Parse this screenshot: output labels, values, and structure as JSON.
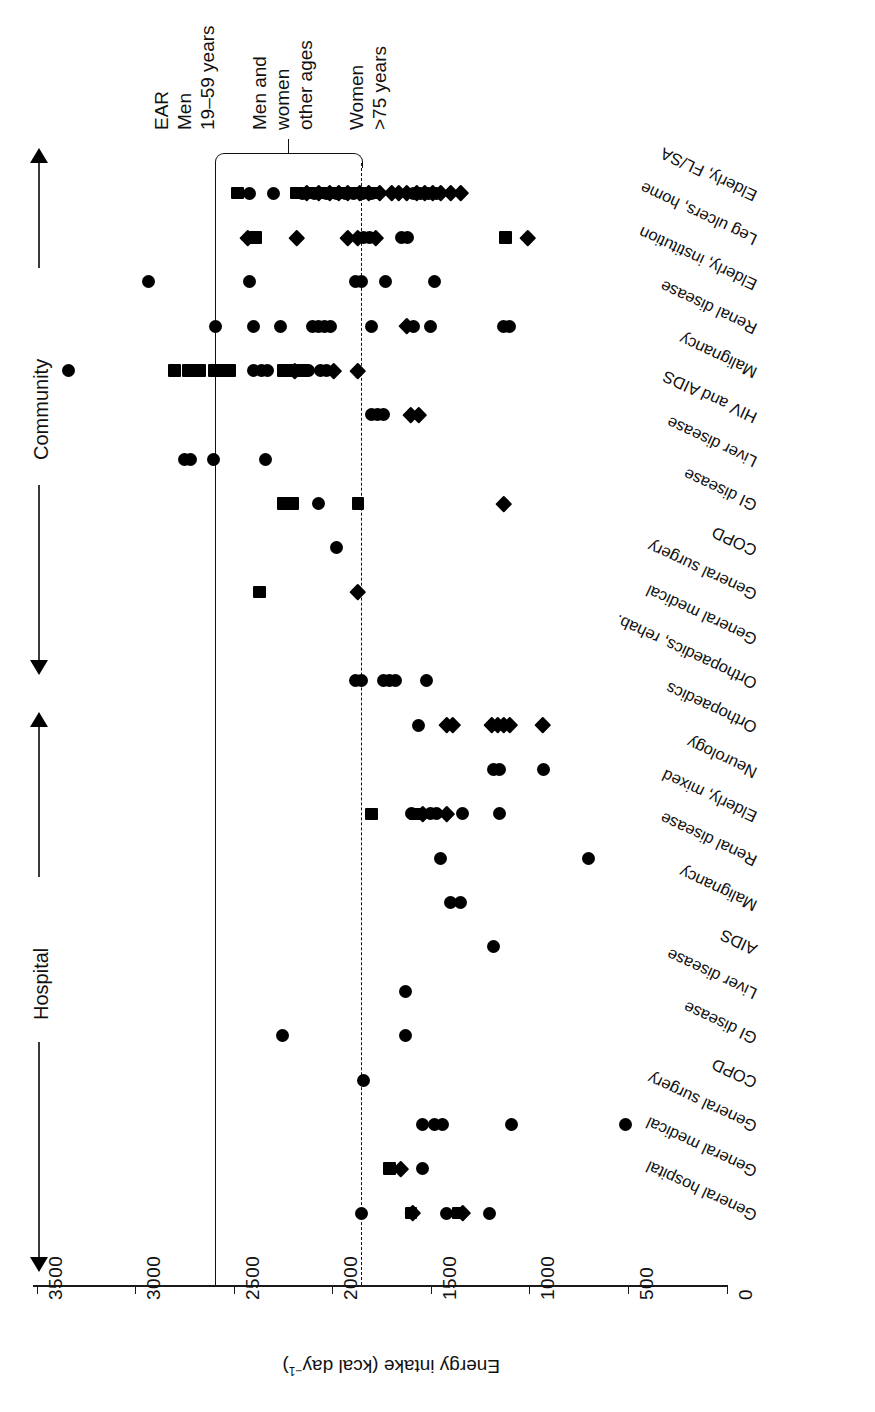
{
  "figure": {
    "axis_title": "Energy intake (kcal day",
    "axis_title_sup": "−1",
    "axis_title_close": ")",
    "tick_labels": [
      "3500",
      "3000",
      "2500",
      "2000",
      "1500",
      "1000",
      "500",
      "0"
    ],
    "tick_values": [
      3500,
      3000,
      2500,
      2000,
      1500,
      1000,
      500,
      0
    ]
  },
  "groups": {
    "community": "Community",
    "hospital": "Hospital"
  },
  "annotations": {
    "ear_line1": "EAR",
    "ear_line2": "Men",
    "ear_line3": "19–59 years",
    "mid_line1": "Men and",
    "mid_line2": "women",
    "mid_line3": "other ages",
    "low_line1": "Women",
    "low_line2": ">75 years"
  },
  "reference_lines": [
    {
      "name": "EAR men 19-59 years",
      "value": 2600,
      "style": "solid"
    },
    {
      "name": "Women >75 years",
      "value": 1850,
      "style": "dash-dot"
    }
  ],
  "chart_data": {
    "type": "scatter",
    "title": "",
    "xlabel": "Energy intake (kcal day−1)",
    "ylabel": "",
    "xlim": [
      0,
      3500
    ],
    "grid": false,
    "legend": "none",
    "orientation": "rotated-180",
    "marker_types": [
      "square",
      "circle",
      "diamond"
    ],
    "categories": [
      {
        "group": "Community",
        "label": "Elderly, FL/SA",
        "points": [
          {
            "v": 2480,
            "m": "square"
          },
          {
            "v": 2420,
            "m": "circle"
          },
          {
            "v": 2300,
            "m": "circle"
          },
          {
            "v": 2180,
            "m": "square"
          },
          {
            "v": 2150,
            "m": "circle"
          },
          {
            "v": 2130,
            "m": "diamond"
          },
          {
            "v": 2110,
            "m": "square"
          },
          {
            "v": 2090,
            "m": "circle"
          },
          {
            "v": 2070,
            "m": "diamond"
          },
          {
            "v": 2050,
            "m": "square"
          },
          {
            "v": 2030,
            "m": "circle"
          },
          {
            "v": 2010,
            "m": "diamond"
          },
          {
            "v": 1995,
            "m": "square"
          },
          {
            "v": 1980,
            "m": "circle"
          },
          {
            "v": 1965,
            "m": "diamond"
          },
          {
            "v": 1950,
            "m": "square"
          },
          {
            "v": 1935,
            "m": "circle"
          },
          {
            "v": 1920,
            "m": "diamond"
          },
          {
            "v": 1905,
            "m": "square"
          },
          {
            "v": 1890,
            "m": "circle"
          },
          {
            "v": 1875,
            "m": "square"
          },
          {
            "v": 1860,
            "m": "diamond"
          },
          {
            "v": 1845,
            "m": "circle"
          },
          {
            "v": 1830,
            "m": "square"
          },
          {
            "v": 1815,
            "m": "diamond"
          },
          {
            "v": 1800,
            "m": "circle"
          },
          {
            "v": 1780,
            "m": "square"
          },
          {
            "v": 1760,
            "m": "diamond"
          },
          {
            "v": 1700,
            "m": "diamond"
          },
          {
            "v": 1660,
            "m": "diamond"
          },
          {
            "v": 1620,
            "m": "diamond"
          },
          {
            "v": 1590,
            "m": "circle"
          },
          {
            "v": 1570,
            "m": "diamond"
          },
          {
            "v": 1550,
            "m": "circle"
          },
          {
            "v": 1530,
            "m": "diamond"
          },
          {
            "v": 1510,
            "m": "circle"
          },
          {
            "v": 1490,
            "m": "diamond"
          },
          {
            "v": 1470,
            "m": "circle"
          },
          {
            "v": 1450,
            "m": "diamond"
          },
          {
            "v": 1400,
            "m": "diamond"
          },
          {
            "v": 1350,
            "m": "diamond"
          }
        ]
      },
      {
        "group": "Community",
        "label": "Leg ulcers, home",
        "points": [
          {
            "v": 2430,
            "m": "diamond"
          },
          {
            "v": 2390,
            "m": "square"
          },
          {
            "v": 2180,
            "m": "diamond"
          },
          {
            "v": 1920,
            "m": "diamond"
          },
          {
            "v": 1870,
            "m": "diamond"
          },
          {
            "v": 1840,
            "m": "circle"
          },
          {
            "v": 1810,
            "m": "circle"
          },
          {
            "v": 1780,
            "m": "diamond"
          },
          {
            "v": 1650,
            "m": "circle"
          },
          {
            "v": 1620,
            "m": "circle"
          },
          {
            "v": 1120,
            "m": "square"
          },
          {
            "v": 1010,
            "m": "diamond"
          }
        ]
      },
      {
        "group": "Community",
        "label": "Elderly, institution",
        "points": [
          {
            "v": 1880,
            "m": "circle"
          },
          {
            "v": 1850,
            "m": "circle"
          },
          {
            "v": 1730,
            "m": "circle"
          },
          {
            "v": 2930,
            "m": "circle"
          },
          {
            "v": 2420,
            "m": "circle"
          },
          {
            "v": 1480,
            "m": "circle"
          }
        ]
      },
      {
        "group": "Community",
        "label": "Renal disease",
        "points": [
          {
            "v": 2590,
            "m": "circle"
          },
          {
            "v": 2400,
            "m": "circle"
          },
          {
            "v": 2260,
            "m": "circle"
          },
          {
            "v": 2100,
            "m": "circle"
          },
          {
            "v": 2070,
            "m": "circle"
          },
          {
            "v": 2040,
            "m": "circle"
          },
          {
            "v": 2010,
            "m": "circle"
          },
          {
            "v": 1800,
            "m": "circle"
          },
          {
            "v": 1620,
            "m": "diamond"
          },
          {
            "v": 1590,
            "m": "circle"
          },
          {
            "v": 1500,
            "m": "circle"
          },
          {
            "v": 1130,
            "m": "circle"
          },
          {
            "v": 1100,
            "m": "circle"
          }
        ]
      },
      {
        "group": "Community",
        "label": "Malignancy",
        "points": [
          {
            "v": 3340,
            "m": "circle"
          },
          {
            "v": 2800,
            "m": "square"
          },
          {
            "v": 2730,
            "m": "square"
          },
          {
            "v": 2700,
            "m": "circle"
          },
          {
            "v": 2670,
            "m": "square"
          },
          {
            "v": 2600,
            "m": "square"
          },
          {
            "v": 2560,
            "m": "square"
          },
          {
            "v": 2520,
            "m": "square"
          },
          {
            "v": 2400,
            "m": "circle"
          },
          {
            "v": 2360,
            "m": "circle"
          },
          {
            "v": 2330,
            "m": "circle"
          },
          {
            "v": 2250,
            "m": "square"
          },
          {
            "v": 2220,
            "m": "square"
          },
          {
            "v": 2190,
            "m": "diamond"
          },
          {
            "v": 2150,
            "m": "square"
          },
          {
            "v": 2120,
            "m": "circle"
          },
          {
            "v": 2060,
            "m": "circle"
          },
          {
            "v": 2030,
            "m": "circle"
          },
          {
            "v": 1990,
            "m": "diamond"
          },
          {
            "v": 1870,
            "m": "diamond"
          }
        ]
      },
      {
        "group": "Community",
        "label": "HIV and AIDS",
        "points": [
          {
            "v": 1800,
            "m": "circle"
          },
          {
            "v": 1770,
            "m": "circle"
          },
          {
            "v": 1740,
            "m": "circle"
          },
          {
            "v": 1600,
            "m": "diamond"
          },
          {
            "v": 1560,
            "m": "diamond"
          }
        ]
      },
      {
        "group": "Community",
        "label": "Liver disease",
        "points": [
          {
            "v": 2750,
            "m": "circle"
          },
          {
            "v": 2720,
            "m": "circle"
          },
          {
            "v": 2600,
            "m": "circle"
          },
          {
            "v": 2340,
            "m": "circle"
          }
        ]
      },
      {
        "group": "Community",
        "label": "GI disease",
        "points": [
          {
            "v": 2250,
            "m": "square"
          },
          {
            "v": 2200,
            "m": "square"
          },
          {
            "v": 2070,
            "m": "circle"
          },
          {
            "v": 1870,
            "m": "square"
          },
          {
            "v": 1130,
            "m": "diamond"
          }
        ]
      },
      {
        "group": "Community",
        "label": "COPD",
        "points": [
          {
            "v": 1980,
            "m": "circle"
          }
        ]
      },
      {
        "group": "Community",
        "label": "General surgery",
        "points": [
          {
            "v": 2370,
            "m": "square"
          },
          {
            "v": 1870,
            "m": "diamond"
          }
        ]
      },
      {
        "group": "Community",
        "label": "General medical",
        "points": []
      },
      {
        "group": "Hospital",
        "label": "Orthopaedics, rehab.",
        "points": [
          {
            "v": 1880,
            "m": "circle"
          },
          {
            "v": 1850,
            "m": "circle"
          },
          {
            "v": 1740,
            "m": "circle"
          },
          {
            "v": 1710,
            "m": "circle"
          },
          {
            "v": 1680,
            "m": "circle"
          },
          {
            "v": 1520,
            "m": "circle"
          }
        ]
      },
      {
        "group": "Hospital",
        "label": "Orthopaedics",
        "points": [
          {
            "v": 1560,
            "m": "circle"
          },
          {
            "v": 1420,
            "m": "diamond"
          },
          {
            "v": 1390,
            "m": "diamond"
          },
          {
            "v": 1190,
            "m": "diamond"
          },
          {
            "v": 1160,
            "m": "diamond"
          },
          {
            "v": 1130,
            "m": "diamond"
          },
          {
            "v": 1100,
            "m": "diamond"
          },
          {
            "v": 930,
            "m": "diamond"
          }
        ]
      },
      {
        "group": "Hospital",
        "label": "Neurology",
        "points": [
          {
            "v": 1180,
            "m": "circle"
          },
          {
            "v": 1150,
            "m": "circle"
          },
          {
            "v": 930,
            "m": "circle"
          }
        ]
      },
      {
        "group": "Hospital",
        "label": "Elderly, mixed",
        "points": [
          {
            "v": 1800,
            "m": "square"
          },
          {
            "v": 1600,
            "m": "circle"
          },
          {
            "v": 1580,
            "m": "square"
          },
          {
            "v": 1540,
            "m": "diamond"
          },
          {
            "v": 1500,
            "m": "circle"
          },
          {
            "v": 1470,
            "m": "circle"
          },
          {
            "v": 1420,
            "m": "diamond"
          },
          {
            "v": 1340,
            "m": "circle"
          },
          {
            "v": 1150,
            "m": "circle"
          }
        ]
      },
      {
        "group": "Hospital",
        "label": "Renal disease",
        "points": [
          {
            "v": 1450,
            "m": "circle"
          },
          {
            "v": 700,
            "m": "circle"
          }
        ]
      },
      {
        "group": "Hospital",
        "label": "Malignancy",
        "points": [
          {
            "v": 1400,
            "m": "circle"
          },
          {
            "v": 1350,
            "m": "circle"
          }
        ]
      },
      {
        "group": "Hospital",
        "label": "AIDS",
        "points": [
          {
            "v": 1180,
            "m": "circle"
          }
        ]
      },
      {
        "group": "Hospital",
        "label": "Liver disease",
        "points": [
          {
            "v": 1630,
            "m": "circle"
          }
        ]
      },
      {
        "group": "Hospital",
        "label": "GI disease",
        "points": [
          {
            "v": 2250,
            "m": "circle"
          },
          {
            "v": 1630,
            "m": "circle"
          }
        ]
      },
      {
        "group": "Hospital",
        "label": "COPD",
        "points": [
          {
            "v": 1840,
            "m": "circle"
          }
        ]
      },
      {
        "group": "Hospital",
        "label": "General surgery",
        "points": [
          {
            "v": 1540,
            "m": "circle"
          },
          {
            "v": 1480,
            "m": "circle"
          },
          {
            "v": 1440,
            "m": "circle"
          },
          {
            "v": 1090,
            "m": "circle"
          },
          {
            "v": 510,
            "m": "circle"
          }
        ]
      },
      {
        "group": "Hospital",
        "label": "General medical",
        "points": [
          {
            "v": 1710,
            "m": "square"
          },
          {
            "v": 1650,
            "m": "diamond"
          },
          {
            "v": 1540,
            "m": "circle"
          }
        ]
      },
      {
        "group": "Hospital",
        "label": "General hospital",
        "points": [
          {
            "v": 1850,
            "m": "circle"
          },
          {
            "v": 1600,
            "m": "square"
          },
          {
            "v": 1590,
            "m": "diamond"
          },
          {
            "v": 1420,
            "m": "circle"
          },
          {
            "v": 1360,
            "m": "square"
          },
          {
            "v": 1340,
            "m": "diamond"
          },
          {
            "v": 1200,
            "m": "circle"
          }
        ]
      }
    ]
  }
}
